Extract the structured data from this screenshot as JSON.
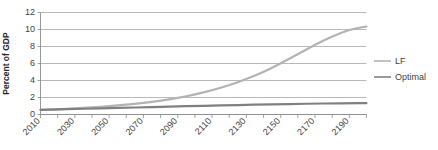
{
  "chart_data": {
    "type": "line",
    "title": "",
    "subtitle": "",
    "xlabel": "",
    "ylabel": "Percent of GDP",
    "xlim": [
      2010,
      2200
    ],
    "ylim": [
      0,
      12
    ],
    "grid": true,
    "grid_axis": "y",
    "legend_position": "right",
    "y_ticks": [
      0,
      2,
      4,
      6,
      8,
      10,
      12
    ],
    "y_tick_labels": [
      "0",
      "2",
      "4",
      "6",
      "8",
      "10",
      "12"
    ],
    "x_ticks": [
      2010,
      2030,
      2050,
      2070,
      2090,
      2110,
      2130,
      2150,
      2170,
      2190
    ],
    "x_tick_labels": [
      "2010",
      "2030",
      "2050",
      "2070",
      "2090",
      "2110",
      "2130",
      "2150",
      "2170",
      "2190"
    ],
    "x_minor_tick_interval": 10,
    "x": [
      2010,
      2020,
      2030,
      2040,
      2050,
      2060,
      2070,
      2080,
      2090,
      2100,
      2110,
      2120,
      2130,
      2140,
      2150,
      2160,
      2170,
      2180,
      2190,
      2200
    ],
    "series": [
      {
        "name": "LF",
        "color": "#b3b3b3",
        "width": 2.2,
        "values": [
          0.55,
          0.62,
          0.72,
          0.84,
          0.98,
          1.15,
          1.36,
          1.62,
          1.95,
          2.35,
          2.85,
          3.45,
          4.15,
          5.0,
          6.0,
          7.1,
          8.2,
          9.2,
          10.0,
          10.35
        ]
      },
      {
        "name": "Optimal",
        "color": "#808080",
        "width": 2.2,
        "values": [
          0.55,
          0.6,
          0.65,
          0.7,
          0.75,
          0.8,
          0.85,
          0.9,
          0.95,
          1.0,
          1.05,
          1.09,
          1.13,
          1.17,
          1.21,
          1.25,
          1.28,
          1.31,
          1.33,
          1.35
        ]
      }
    ]
  },
  "legend": {
    "entries": [
      {
        "label": "LF",
        "color": "#b3b3b3"
      },
      {
        "label": "Optimal",
        "color": "#808080"
      }
    ]
  },
  "axes": {
    "y_title": "Percent of GDP",
    "y_labels": [
      "12",
      "10",
      "8",
      "6",
      "4",
      "2",
      "0"
    ],
    "x_labels": [
      "2010",
      "2030",
      "2050",
      "2070",
      "2090",
      "2110",
      "2130",
      "2150",
      "2170",
      "2190"
    ]
  },
  "colors": {
    "grid": "#a6a6a6",
    "axis": "#8c8c8c",
    "text": "#3f3f3f",
    "title_text": "#262626",
    "background": "#ffffff",
    "series_lf": "#b3b3b3",
    "series_optimal": "#808080"
  }
}
